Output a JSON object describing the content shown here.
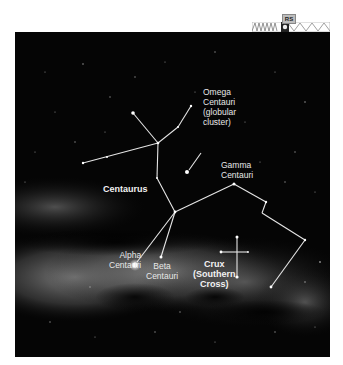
{
  "figure": {
    "labels": {
      "omega": "Omega\nCentauri\n(globular\ncluster)",
      "centaurus": "Centaurus",
      "gamma": "Gamma\nCentauri",
      "alpha": "Alpha\nCentauri",
      "beta": "Beta\nCentauri",
      "crux": "Crux\n(Southern\nCross)"
    },
    "badge": "RS",
    "colors": {
      "sky": "#050505",
      "milky_way": "#8a8a8a",
      "lines": "#e6e6e6",
      "labels": "#e8e8e8"
    }
  }
}
